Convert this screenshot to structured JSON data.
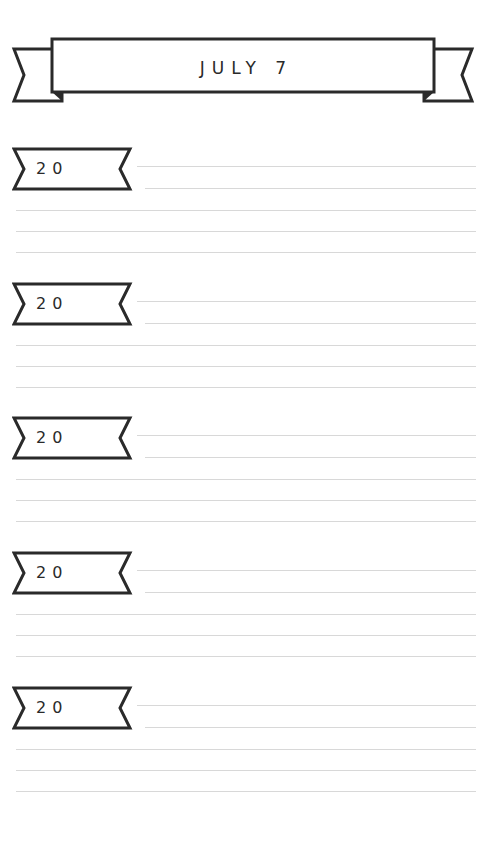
{
  "header": {
    "title": "JULY 7"
  },
  "colors": {
    "ink": "#2a2a2a",
    "rule_line": "#d8d8d8",
    "background": "#ffffff"
  },
  "sections": [
    {
      "year_prefix": "20",
      "lines": [
        "",
        "",
        "",
        "",
        ""
      ]
    },
    {
      "year_prefix": "20",
      "lines": [
        "",
        "",
        "",
        "",
        ""
      ]
    },
    {
      "year_prefix": "20",
      "lines": [
        "",
        "",
        "",
        "",
        ""
      ]
    },
    {
      "year_prefix": "20",
      "lines": [
        "",
        "",
        "",
        "",
        ""
      ]
    },
    {
      "year_prefix": "20",
      "lines": [
        "",
        "",
        "",
        "",
        ""
      ]
    }
  ]
}
